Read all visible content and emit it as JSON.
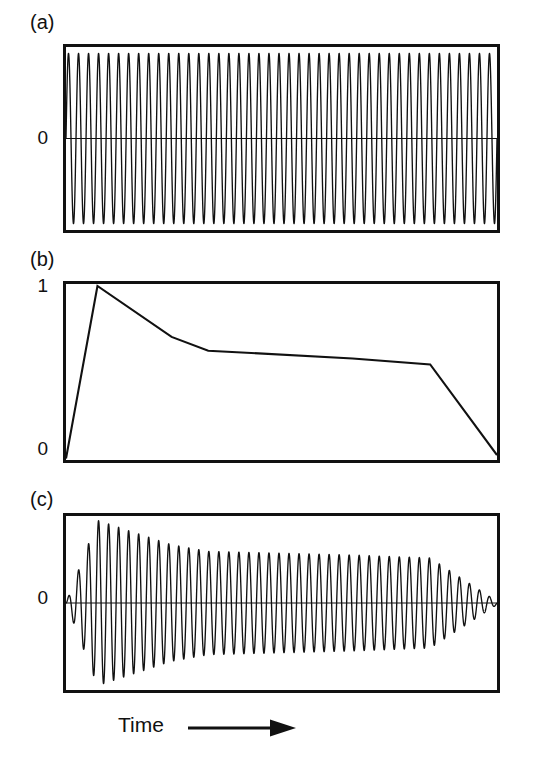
{
  "figure": {
    "caption_axis": "Time",
    "arrow_icon": "right-arrow-icon",
    "background_color": "#ffffff",
    "ink_color": "#111111"
  },
  "panels": [
    {
      "id": "a",
      "letter": "(a)",
      "y_labels": [
        "0"
      ],
      "description": "constant-amplitude carrier waveform"
    },
    {
      "id": "b",
      "letter": "(b)",
      "y_labels": [
        "1",
        "0"
      ],
      "description": "ADSR amplitude envelope"
    },
    {
      "id": "c",
      "letter": "(c)",
      "y_labels": [
        "0"
      ],
      "description": "carrier multiplied by envelope"
    }
  ],
  "chart_data": [
    {
      "type": "line",
      "id": "panel-a",
      "title": "(a)",
      "xlabel": "Time",
      "ylabel": "",
      "ylim": [
        -1.15,
        1.15
      ],
      "xlim": [
        0,
        1
      ],
      "grid": false,
      "legend": "none",
      "tick_labels_y": [
        "0"
      ],
      "tick_values_y": [
        0
      ],
      "annotations": [
        "0"
      ],
      "waveform": {
        "kind": "sine-carrier",
        "cycles": 43,
        "amplitude": 1.0,
        "amplitude_profile": "constant",
        "zero_line": true
      }
    },
    {
      "type": "line",
      "id": "panel-b",
      "title": "(b)",
      "xlabel": "Time",
      "ylabel": "",
      "ylim": [
        0,
        1.05
      ],
      "xlim": [
        0,
        1
      ],
      "grid": false,
      "legend": "none",
      "tick_labels_y": [
        "1",
        "0"
      ],
      "tick_values_y": [
        1,
        0
      ],
      "envelope_segments": [
        "attack",
        "decay",
        "sustain",
        "release"
      ],
      "x": [
        0.0,
        0.073,
        0.245,
        0.33,
        0.665,
        0.845,
        1.0
      ],
      "values": [
        0.0,
        1.0,
        0.705,
        0.625,
        0.58,
        0.545,
        0.02
      ],
      "breakpoints": [
        {
          "name": "start",
          "x": 0.0,
          "y": 0.0
        },
        {
          "name": "attack-peak",
          "x": 0.073,
          "y": 1.0
        },
        {
          "name": "decay-knee",
          "x": 0.245,
          "y": 0.705
        },
        {
          "name": "sustain-start",
          "x": 0.33,
          "y": 0.625
        },
        {
          "name": "sustain-end",
          "x": 0.665,
          "y": 0.58
        },
        {
          "name": "release-knee",
          "x": 0.845,
          "y": 0.545
        },
        {
          "name": "end",
          "x": 1.0,
          "y": 0.02
        }
      ]
    },
    {
      "type": "line",
      "id": "panel-c",
      "title": "(c)",
      "xlabel": "Time",
      "ylabel": "",
      "ylim": [
        -1.15,
        1.15
      ],
      "xlim": [
        0,
        1
      ],
      "grid": false,
      "legend": "none",
      "tick_labels_y": [
        "0"
      ],
      "tick_values_y": [
        0
      ],
      "annotations": [
        "0"
      ],
      "waveform": {
        "kind": "amplitude-modulated-carrier",
        "cycles": 43,
        "amplitude_profile": "panel-b envelope",
        "zero_line": true
      }
    }
  ]
}
